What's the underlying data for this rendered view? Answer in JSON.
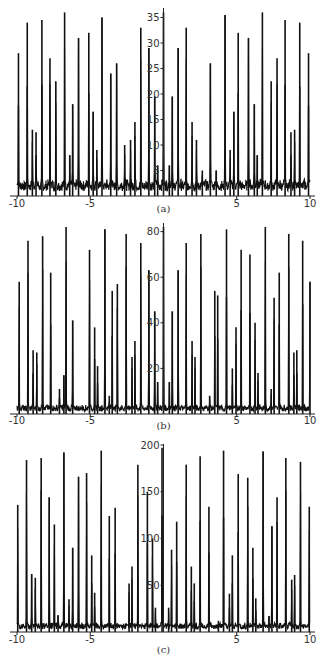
{
  "chart_data": [
    {
      "type": "line",
      "panel_label": "(a)",
      "title": "",
      "xlabel": "",
      "ylabel": "",
      "xlim": [
        -10,
        10
      ],
      "ylim": [
        0,
        37
      ],
      "xticks": [
        -10,
        -5,
        5,
        10
      ],
      "yticks": [
        5,
        10,
        15,
        20,
        25,
        30,
        35
      ],
      "grid": false,
      "legend": null,
      "baseline_noise": 4,
      "peaks": [
        [
          -9.9,
          28
        ],
        [
          -9.3,
          34
        ],
        [
          -8.95,
          13
        ],
        [
          -8.7,
          12.5
        ],
        [
          -8.3,
          34.5
        ],
        [
          -7.75,
          27
        ],
        [
          -7.35,
          22.5
        ],
        [
          -6.75,
          36
        ],
        [
          -6.4,
          8
        ],
        [
          -6.2,
          18
        ],
        [
          -5.8,
          31
        ],
        [
          -5.1,
          32
        ],
        [
          -4.8,
          16.5
        ],
        [
          -4.55,
          9
        ],
        [
          -4.2,
          35
        ],
        [
          -3.6,
          24
        ],
        [
          -3.2,
          26
        ],
        [
          -2.65,
          10
        ],
        [
          -2.25,
          11
        ],
        [
          -1.95,
          14.5
        ],
        [
          -1.55,
          33
        ],
        [
          -1.0,
          29
        ],
        [
          -0.6,
          19.5
        ],
        [
          -0.4,
          6
        ],
        [
          0.0,
          36
        ],
        [
          0.4,
          6
        ],
        [
          0.6,
          19.5
        ],
        [
          1.0,
          29
        ],
        [
          1.55,
          33
        ],
        [
          1.95,
          14.5
        ],
        [
          2.25,
          11
        ],
        [
          2.65,
          5
        ],
        [
          3.2,
          26
        ],
        [
          3.6,
          5
        ],
        [
          4.2,
          35.5
        ],
        [
          4.55,
          9
        ],
        [
          4.8,
          16.5
        ],
        [
          5.1,
          32
        ],
        [
          5.8,
          31
        ],
        [
          6.2,
          18
        ],
        [
          6.4,
          8
        ],
        [
          6.75,
          36
        ],
        [
          7.35,
          22.5
        ],
        [
          7.75,
          27
        ],
        [
          8.3,
          34.5
        ],
        [
          8.7,
          12.5
        ],
        [
          8.95,
          13
        ],
        [
          9.3,
          34
        ],
        [
          9.9,
          28
        ]
      ]
    },
    {
      "type": "line",
      "panel_label": "(b)",
      "title": "",
      "xlabel": "",
      "ylabel": "",
      "xlim": [
        -10,
        10
      ],
      "ylim": [
        0,
        83
      ],
      "xticks": [
        -10,
        -5,
        5,
        10
      ],
      "yticks": [
        20,
        40,
        60,
        80
      ],
      "grid": false,
      "legend": null,
      "baseline_noise": 5,
      "peaks": [
        [
          -9.85,
          58
        ],
        [
          -9.25,
          76
        ],
        [
          -8.9,
          28
        ],
        [
          -8.65,
          27
        ],
        [
          -8.25,
          78
        ],
        [
          -7.7,
          62
        ],
        [
          -7.1,
          11
        ],
        [
          -6.8,
          17
        ],
        [
          -6.65,
          82
        ],
        [
          -6.2,
          41
        ],
        [
          -5.05,
          72
        ],
        [
          -4.7,
          38
        ],
        [
          -4.5,
          21
        ],
        [
          -4.0,
          81
        ],
        [
          -3.7,
          8
        ],
        [
          -3.5,
          54
        ],
        [
          -3.15,
          57
        ],
        [
          -2.55,
          79
        ],
        [
          -2.15,
          25
        ],
        [
          -1.95,
          32
        ],
        [
          -1.55,
          75
        ],
        [
          -1.0,
          63
        ],
        [
          -0.6,
          45
        ],
        [
          -0.4,
          14
        ],
        [
          0.0,
          82
        ],
        [
          0.4,
          14
        ],
        [
          0.6,
          45
        ],
        [
          1.0,
          63
        ],
        [
          1.55,
          75
        ],
        [
          1.95,
          32
        ],
        [
          2.15,
          25
        ],
        [
          2.55,
          79
        ],
        [
          3.15,
          8
        ],
        [
          3.5,
          54
        ],
        [
          3.7,
          52
        ],
        [
          4.3,
          81
        ],
        [
          4.7,
          20
        ],
        [
          4.95,
          38
        ],
        [
          5.3,
          72
        ],
        [
          5.9,
          70
        ],
        [
          6.25,
          40
        ],
        [
          6.45,
          18
        ],
        [
          6.95,
          82
        ],
        [
          7.35,
          11
        ],
        [
          7.55,
          51
        ],
        [
          7.9,
          62
        ],
        [
          8.55,
          79
        ],
        [
          8.9,
          27
        ],
        [
          9.1,
          28
        ],
        [
          9.5,
          76
        ],
        [
          10.0,
          58
        ]
      ]
    },
    {
      "type": "line",
      "panel_label": "(c)",
      "title": "",
      "xlabel": "",
      "ylabel": "",
      "xlim": [
        -10,
        10
      ],
      "ylim": [
        0,
        200
      ],
      "xticks": [
        -10,
        -5,
        5,
        10
      ],
      "yticks": [
        50,
        100,
        150,
        200
      ],
      "grid": false,
      "legend": null,
      "baseline_noise": 12,
      "peaks": [
        [
          -9.95,
          136
        ],
        [
          -9.35,
          184
        ],
        [
          -9.0,
          62
        ],
        [
          -8.75,
          58
        ],
        [
          -8.35,
          186
        ],
        [
          -7.8,
          144
        ],
        [
          -7.45,
          115
        ],
        [
          -7.2,
          18
        ],
        [
          -6.8,
          192
        ],
        [
          -6.45,
          35
        ],
        [
          -6.2,
          90
        ],
        [
          -5.8,
          166
        ],
        [
          -5.25,
          170
        ],
        [
          -4.9,
          82
        ],
        [
          -4.7,
          42
        ],
        [
          -4.25,
          194
        ],
        [
          -3.7,
          124
        ],
        [
          -3.3,
          133
        ],
        [
          -2.35,
          52
        ],
        [
          -2.15,
          70
        ],
        [
          -1.75,
          179
        ],
        [
          -1.1,
          150
        ],
        [
          -0.75,
          100
        ],
        [
          -0.55,
          26
        ],
        [
          -0.1,
          197
        ],
        [
          0.35,
          26
        ],
        [
          0.55,
          88
        ],
        [
          0.9,
          118
        ],
        [
          1.55,
          179
        ],
        [
          1.9,
          70
        ],
        [
          2.1,
          52
        ],
        [
          2.5,
          188
        ],
        [
          3.1,
          134
        ],
        [
          3.75,
          12
        ],
        [
          4.1,
          194
        ],
        [
          4.5,
          41
        ],
        [
          4.7,
          82
        ],
        [
          5.1,
          169
        ],
        [
          5.75,
          165
        ],
        [
          6.1,
          90
        ],
        [
          6.3,
          36
        ],
        [
          6.8,
          193
        ],
        [
          7.2,
          17
        ],
        [
          7.4,
          113
        ],
        [
          7.75,
          144
        ],
        [
          8.35,
          186
        ],
        [
          8.75,
          56
        ],
        [
          8.95,
          61
        ],
        [
          9.35,
          182
        ],
        [
          9.95,
          134
        ]
      ]
    }
  ],
  "panels": [
    {
      "caption": "(a)",
      "xtick_labels": [
        "-10",
        "-5",
        "5",
        "10"
      ],
      "ytick_labels": [
        "5",
        "10",
        "15",
        "20",
        "25",
        "30",
        "35"
      ]
    },
    {
      "caption": "(b)",
      "xtick_labels": [
        "-10",
        "-5",
        "5",
        "10"
      ],
      "ytick_labels": [
        "20",
        "40",
        "60",
        "80"
      ]
    },
    {
      "caption": "(c)",
      "xtick_labels": [
        "-10",
        "-5",
        "5",
        "10"
      ],
      "ytick_labels": [
        "50",
        "100",
        "150",
        "200"
      ]
    }
  ],
  "colors": {
    "line": "#111111",
    "axis": "#222222",
    "text": "#333333"
  }
}
